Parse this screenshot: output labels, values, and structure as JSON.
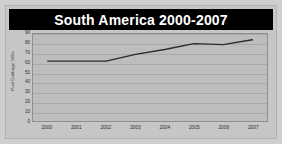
{
  "chart_data": {
    "type": "line",
    "title": "South America 2000-2007",
    "xlabel": "",
    "ylabel": "Pool Cabbage '000s",
    "categories": [
      "2000",
      "2001",
      "2002",
      "2003",
      "2004",
      "2005",
      "2006",
      "2007"
    ],
    "x": [
      2000,
      2001,
      2002,
      2003,
      2004,
      2005,
      2006,
      2007
    ],
    "values": [
      62,
      62,
      62,
      69,
      74,
      80,
      79,
      84
    ],
    "series": [
      {
        "name": "South America",
        "values": [
          62,
          62,
          62,
          69,
          74,
          80,
          79,
          84
        ]
      }
    ],
    "ylim": [
      0,
      90
    ],
    "yticks": [
      0,
      10,
      20,
      30,
      40,
      50,
      60,
      70,
      80,
      90
    ],
    "ytick_labels": [
      "0",
      "10",
      "20",
      "30",
      "40",
      "50",
      "60",
      "70",
      "80",
      "90"
    ],
    "grid": true,
    "legend": false,
    "legend_position": "none",
    "markers": false,
    "line_color": "#2b2b2b",
    "plot_background": "#bdbdbd",
    "title_background": "#000000",
    "title_color": "#ffffff",
    "figure_background": "#cfcfcf"
  }
}
